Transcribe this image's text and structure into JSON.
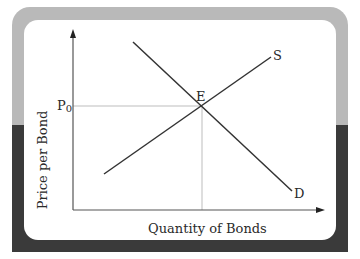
{
  "diagram": {
    "type": "supply-demand",
    "y_axis_label": "Price per Bond",
    "x_axis_label": "Quantity of Bonds",
    "price_tick_label": "P",
    "price_tick_subscript": "0",
    "equilibrium_label": "E",
    "supply_label": "S",
    "demand_label": "D"
  },
  "colors": {
    "frame_top": "#b9b9b9",
    "frame_bottom": "#3a3a3a",
    "panel": "#ffffff",
    "curve": "#333333",
    "guide": "#bdbdbd"
  }
}
